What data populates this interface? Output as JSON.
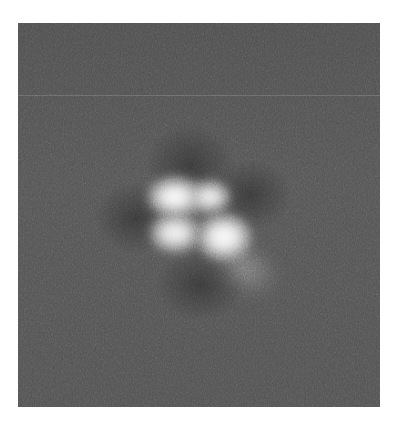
{
  "image": {
    "kind": "grayscale microscopy / diffraction pattern",
    "frame": {
      "x": 18,
      "y": 23,
      "width": 362,
      "height": 384
    },
    "colors": {
      "page_background": "#ffffff",
      "image_background": "#505050",
      "lobe_core": "#ffffff",
      "lobe_edge": "#9a9a9a"
    },
    "features": {
      "scan_line_y": 72,
      "dark_halos": [
        {
          "name": "halo-top",
          "cx": 172,
          "cy": 142,
          "rx": 30,
          "ry": 28
        },
        {
          "name": "halo-left",
          "cx": 118,
          "cy": 195,
          "rx": 28,
          "ry": 24
        },
        {
          "name": "halo-right",
          "cx": 232,
          "cy": 172,
          "rx": 28,
          "ry": 24
        },
        {
          "name": "halo-bottom",
          "cx": 182,
          "cy": 262,
          "rx": 30,
          "ry": 24
        }
      ],
      "lobes": [
        {
          "name": "lobe-top-left",
          "cx": 157,
          "cy": 174,
          "rx": 24,
          "ry": 17,
          "intensity": 1.0
        },
        {
          "name": "lobe-top-right",
          "cx": 192,
          "cy": 174,
          "rx": 17,
          "ry": 14,
          "intensity": 0.95
        },
        {
          "name": "lobe-bottom-left",
          "cx": 157,
          "cy": 210,
          "rx": 22,
          "ry": 16,
          "intensity": 0.95
        },
        {
          "name": "lobe-bottom-right",
          "cx": 206,
          "cy": 214,
          "rx": 24,
          "ry": 20,
          "intensity": 1.0
        }
      ],
      "tail": {
        "cx": 228,
        "cy": 245,
        "rx": 30,
        "ry": 18
      }
    }
  }
}
